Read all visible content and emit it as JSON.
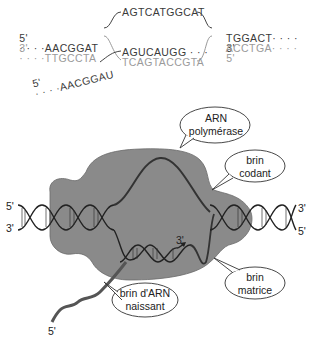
{
  "top_diagram": {
    "left_coding": {
      "prefix": "5'",
      "dots": "· · · ·",
      "seq": "AACGGAT"
    },
    "left_template": {
      "prefix": "3'",
      "dots": "· · · ·",
      "seq": "TTGCCTA"
    },
    "bubble_coding": "AGTCATGGCAT",
    "rna_in_bubble": "AGUCAUGG · · ·",
    "bubble_template": "TCAGTACCGTA",
    "right_coding": {
      "seq": "TGGACT",
      "dots": "· · · ·",
      "suffix": "3'"
    },
    "right_template": {
      "seq": "ACCTGA",
      "dots": "· · · ·",
      "suffix": "5'"
    },
    "rna_exit": {
      "prefix": "5'",
      "dots": "· · · ·",
      "seq": "AACGGAU"
    }
  },
  "bottom_diagram": {
    "labels": {
      "polymerase": "ARN\npolymérase",
      "coding_strand": "brin\ncodant",
      "template_strand": "brin\nmatrice",
      "nascent_rna": "brin d'ARN\nnaissant"
    },
    "ends": {
      "left_top": "5'",
      "left_bottom": "3'",
      "right_top": "3'",
      "right_bottom": "5'",
      "rna_3prime": "3'",
      "rna_5prime": "5'"
    },
    "colors": {
      "polymerase_fill": "#8a8a8a",
      "strand_stroke": "#333333",
      "rna_stroke": "#555555"
    }
  }
}
